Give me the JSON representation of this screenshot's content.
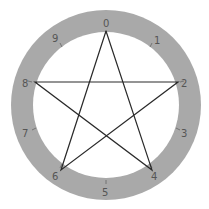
{
  "diagram": {
    "type": "decagon-circle-pentagram",
    "colors": {
      "background": "#ffffff",
      "ring": "#a9a9a9",
      "line": "#2a2a2a",
      "label": "#555555"
    },
    "labels": [
      "0",
      "1",
      "2",
      "3",
      "4",
      "5",
      "6",
      "7",
      "8",
      "9"
    ],
    "star_path_order": [
      "0",
      "4",
      "8",
      "2",
      "6",
      "0"
    ]
  }
}
